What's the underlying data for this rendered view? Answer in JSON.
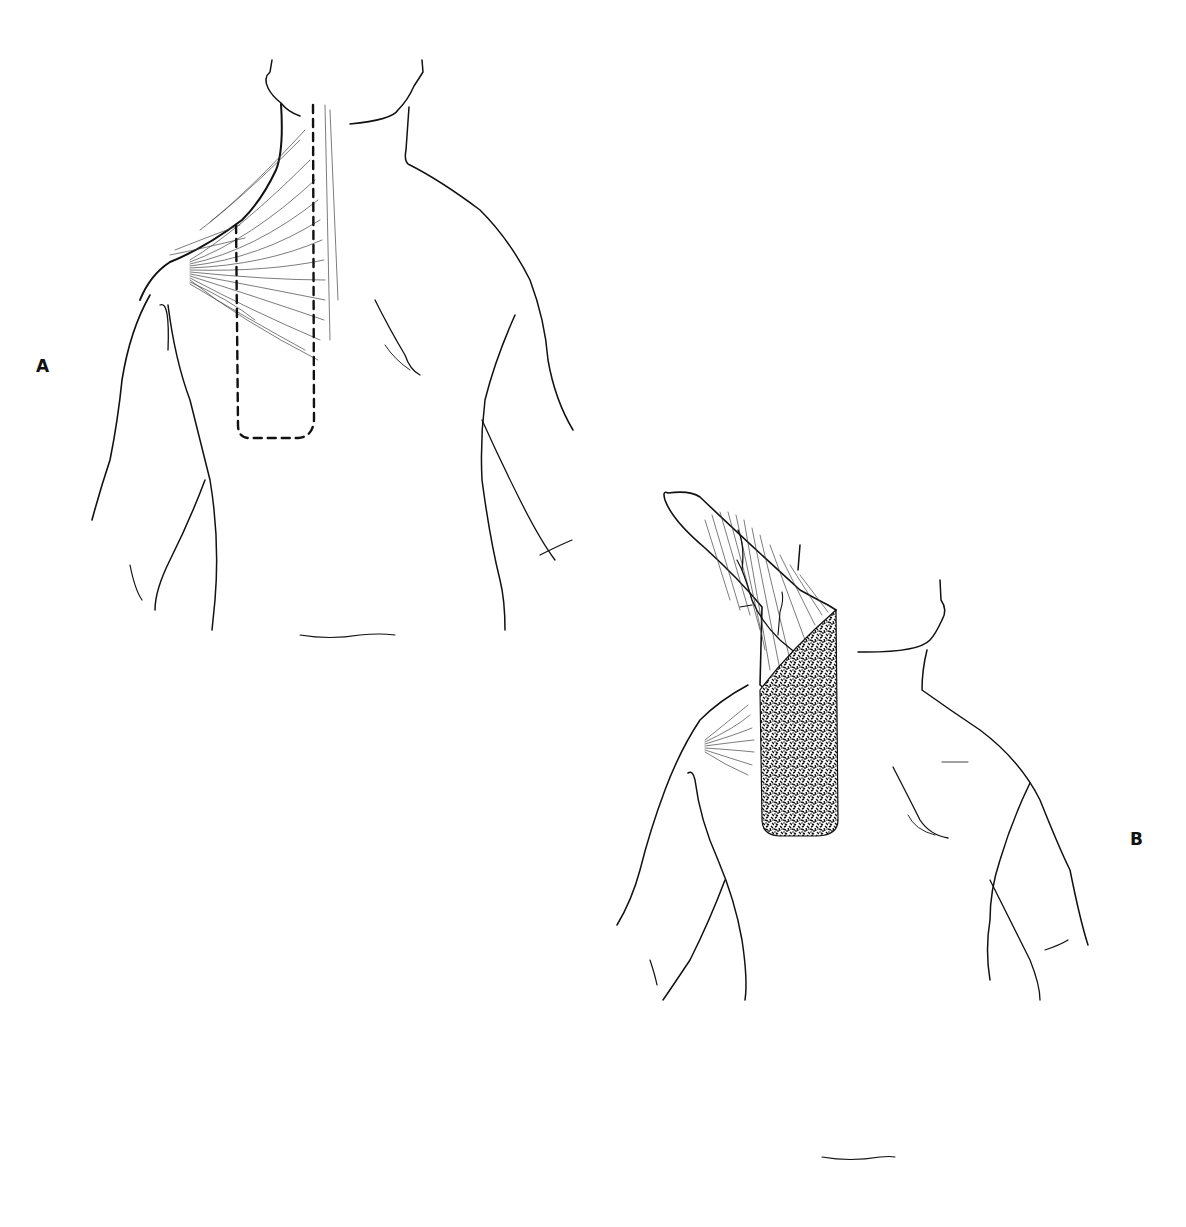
{
  "header": {
    "text": ""
  },
  "figure": {
    "panels": [
      {
        "id": "A",
        "label": "A",
        "description": "Posterior view of upper back and neck with trapezius muscle fibers; dashed outline marks flap design along the spine"
      },
      {
        "id": "B",
        "label": "B",
        "description": "Posterior view with trapezius flap elevated and rotated upward, showing vascular pedicle; stippled donor area"
      }
    ]
  }
}
